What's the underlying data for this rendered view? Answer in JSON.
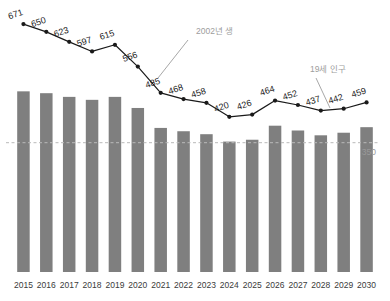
{
  "chart_data": {
    "type": "bar",
    "title": "",
    "subtitle": "",
    "xlabel": "",
    "ylabel": "",
    "ylim": [
      0,
      720
    ],
    "grid": false,
    "legend_position": "none",
    "categories": [
      "2015",
      "2016",
      "2017",
      "2018",
      "2019",
      "2020",
      "2021",
      "2022",
      "2023",
      "2024",
      "2025",
      "2026",
      "2027",
      "2028",
      "2029",
      "2030"
    ],
    "series": [
      {
        "name": "입학정원",
        "type": "bar",
        "color": "#7f7f7f",
        "values": [
          489,
          484,
          474,
          466,
          474,
          444,
          390,
          381,
          373,
          353,
          358,
          396,
          383,
          370,
          377,
          392
        ],
        "labels_shown": false
      },
      {
        "name": "19세 인구",
        "type": "line",
        "color": "#1a1a1a",
        "values": [
          671,
          650,
          623,
          597,
          615,
          556,
          485,
          468,
          458,
          420,
          426,
          464,
          452,
          437,
          442,
          459
        ],
        "labels_shown": true
      }
    ],
    "reference_lines": [
      {
        "value": 350,
        "label": "350",
        "style": "dashed",
        "color": "#b9b9b9"
      }
    ],
    "annotations": [
      {
        "text": "2002년 생",
        "target_category": "2021",
        "target_series": "19세 인구"
      },
      {
        "text": "19세 인구",
        "target_category": "2028",
        "target_series": "19세 인구"
      }
    ]
  },
  "colors": {
    "bar": "#7f7f7f",
    "line": "#1a1a1a",
    "reference": "#b9b9b9",
    "annotation": "#9d9d9d",
    "tick": "#3a3a3a",
    "background": "#ffffff"
  }
}
